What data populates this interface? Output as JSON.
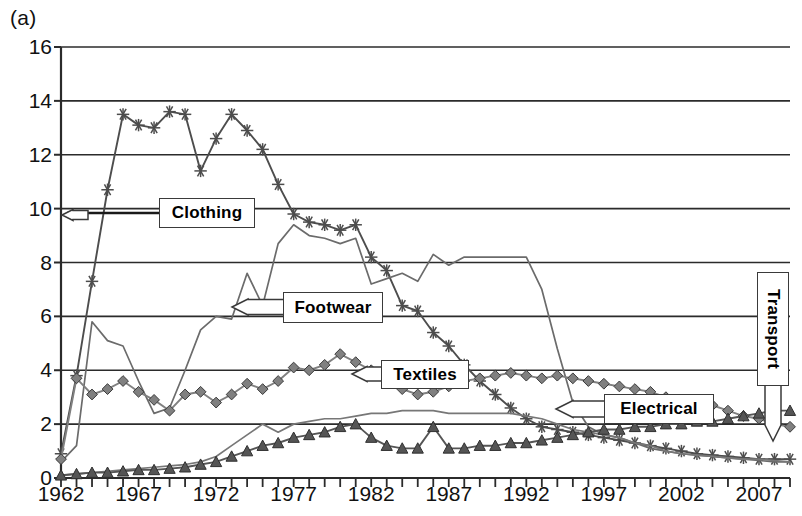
{
  "figure": {
    "panel_label": "(a)",
    "background": "#ffffff",
    "frame_color": "#2b2b2b"
  },
  "chart_data": {
    "type": "line",
    "title": "",
    "xlabel": "",
    "ylabel": "",
    "grid": true,
    "legend_position": "inline-callouts",
    "xlim": [
      1962,
      2009
    ],
    "ylim": [
      0,
      16
    ],
    "yticks": [
      0,
      2,
      4,
      6,
      8,
      10,
      12,
      14,
      16
    ],
    "xticks_labeled": [
      1962,
      1967,
      1972,
      1977,
      1982,
      1987,
      1992,
      1997,
      2002,
      2007
    ],
    "xtick_step": 1,
    "x": [
      1962,
      1963,
      1964,
      1965,
      1966,
      1967,
      1968,
      1969,
      1970,
      1971,
      1972,
      1973,
      1974,
      1975,
      1976,
      1977,
      1978,
      1979,
      1980,
      1981,
      1982,
      1983,
      1984,
      1985,
      1986,
      1987,
      1988,
      1989,
      1990,
      1991,
      1992,
      1993,
      1994,
      1995,
      1996,
      1997,
      1998,
      1999,
      2000,
      2001,
      2002,
      2003,
      2004,
      2005,
      2006,
      2007,
      2008,
      2009
    ],
    "series": [
      {
        "name": "Clothing",
        "marker": "asterisk",
        "color": "#4d4d4d",
        "values": [
          0.9,
          3.8,
          7.3,
          10.7,
          13.5,
          13.1,
          13.0,
          13.6,
          13.5,
          11.4,
          12.6,
          13.5,
          12.9,
          12.2,
          10.9,
          9.8,
          9.5,
          9.4,
          9.2,
          9.4,
          8.2,
          7.7,
          6.4,
          6.2,
          5.4,
          4.9,
          4.2,
          3.6,
          3.1,
          2.6,
          2.2,
          1.9,
          1.8,
          1.7,
          1.6,
          1.5,
          1.4,
          1.3,
          1.2,
          1.1,
          1.0,
          0.9,
          0.85,
          0.8,
          0.75,
          0.7,
          0.7,
          0.7
        ]
      },
      {
        "name": "Footwear",
        "marker": "none",
        "color": "#6b6b6b",
        "values": [
          0.6,
          1.2,
          5.8,
          5.1,
          4.9,
          3.6,
          2.4,
          2.6,
          4.0,
          5.5,
          6.0,
          5.9,
          7.6,
          6.4,
          8.7,
          9.4,
          9.0,
          8.9,
          8.7,
          8.9,
          7.2,
          7.4,
          7.6,
          7.3,
          8.3,
          7.9,
          8.2,
          8.2,
          8.2,
          8.2,
          8.2,
          7.0,
          4.8,
          2.8,
          1.9,
          1.6,
          1.5,
          1.3,
          1.1,
          1.0,
          0.9,
          0.85,
          0.8,
          0.75,
          0.7,
          0.65,
          0.6,
          0.6
        ]
      },
      {
        "name": "Textiles",
        "marker": "diamond",
        "color": "#808080",
        "values": [
          0.7,
          3.7,
          3.1,
          3.3,
          3.6,
          3.2,
          2.9,
          2.5,
          3.1,
          3.2,
          2.8,
          3.1,
          3.5,
          3.3,
          3.6,
          4.1,
          4.0,
          4.2,
          4.6,
          4.3,
          4.0,
          3.6,
          3.3,
          3.1,
          3.2,
          3.4,
          3.6,
          3.7,
          3.8,
          3.9,
          3.8,
          3.7,
          3.8,
          3.7,
          3.6,
          3.5,
          3.4,
          3.3,
          3.2,
          3.0,
          2.9,
          2.8,
          2.7,
          2.5,
          2.3,
          2.2,
          2.0,
          1.9
        ]
      },
      {
        "name": "Electrical",
        "marker": "none",
        "color": "#777777",
        "values": [
          0.1,
          0.15,
          0.2,
          0.25,
          0.3,
          0.35,
          0.4,
          0.45,
          0.5,
          0.6,
          0.8,
          1.2,
          1.6,
          2.0,
          1.7,
          2.0,
          2.1,
          2.2,
          2.2,
          2.3,
          2.4,
          2.4,
          2.5,
          2.5,
          2.5,
          2.4,
          2.4,
          2.4,
          2.4,
          2.4,
          2.3,
          2.2,
          2.0,
          1.8,
          1.7,
          1.6,
          1.5,
          1.3,
          1.2,
          1.0,
          0.9,
          0.85,
          0.8,
          0.75,
          0.7,
          0.7,
          0.65,
          0.6
        ]
      },
      {
        "name": "Transport",
        "marker": "triangle",
        "color": "#555555",
        "values": [
          0.1,
          0.15,
          0.2,
          0.2,
          0.25,
          0.3,
          0.3,
          0.35,
          0.4,
          0.5,
          0.6,
          0.8,
          1.0,
          1.2,
          1.3,
          1.5,
          1.6,
          1.7,
          1.9,
          2.0,
          1.5,
          1.2,
          1.1,
          1.1,
          1.9,
          1.1,
          1.1,
          1.2,
          1.2,
          1.3,
          1.3,
          1.4,
          1.5,
          1.6,
          1.7,
          1.8,
          1.8,
          1.9,
          1.9,
          2.0,
          2.0,
          2.1,
          2.1,
          2.2,
          2.3,
          2.4,
          2.5,
          2.5
        ]
      }
    ]
  },
  "callouts": [
    {
      "label": "Clothing",
      "orientation": "horizontal"
    },
    {
      "label": "Footwear",
      "orientation": "horizontal"
    },
    {
      "label": "Textiles",
      "orientation": "horizontal"
    },
    {
      "label": "Electrical",
      "orientation": "horizontal"
    },
    {
      "label": "Transport",
      "orientation": "vertical"
    }
  ]
}
